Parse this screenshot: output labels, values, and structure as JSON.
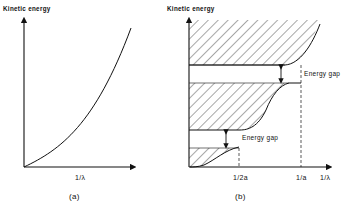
{
  "panels": [
    {
      "id": "a",
      "y_axis_label": "Kinetic energy",
      "x_axis_label": "1/λ",
      "caption": "(a)",
      "description": "Free-electron parabolic dispersion: kinetic energy rising monotonically with 1/λ"
    },
    {
      "id": "b",
      "y_axis_label": "Kinetic energy",
      "x_axis_label": "1/λ",
      "x_ticks": [
        "1/2a",
        "1/a"
      ],
      "caption": "(b)",
      "annotations": [
        "Energy gap",
        "Energy gap"
      ],
      "bands": [
        "lower allowed band (hatched)",
        "middle allowed band (hatched)",
        "upper allowed band (hatched)"
      ],
      "description": "Nearly-free-electron bands with energy gaps opening at 1/λ = 1/2a and 1/λ = 1/a"
    }
  ],
  "colors": {
    "ink": "#111111",
    "background": "#ffffff"
  }
}
